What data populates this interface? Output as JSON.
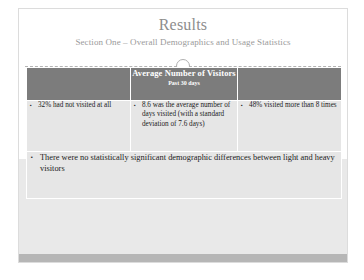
{
  "slide": {
    "title": "Results",
    "subtitle": "Section One – Overall Demographics and Usage Statistics",
    "divider_icon": "circle-marker",
    "colors": {
      "header_band": "#7c7c7c",
      "body_cell": "#e6e6e6",
      "bottom_bar": "#b6b6b6",
      "title_text": "#8d8d8d",
      "subtitle_text": "#9a9a9a"
    }
  },
  "table": {
    "headers": [
      {
        "title": "",
        "subtitle": ""
      },
      {
        "title": "Average Number of Visitors",
        "subtitle": "Past 30 days"
      },
      {
        "title": "",
        "subtitle": ""
      }
    ],
    "row": [
      {
        "bullets": [
          "32% had not visited at all"
        ]
      },
      {
        "bullets": [
          "8.6 was the average number of days visited (with a standard deviation of 7.6 days)"
        ]
      },
      {
        "bullets": [
          "48% visited more than 8 times"
        ]
      }
    ]
  },
  "summary": {
    "bullets": [
      "There were no statistically significant demographic differences between light and heavy visitors"
    ]
  }
}
